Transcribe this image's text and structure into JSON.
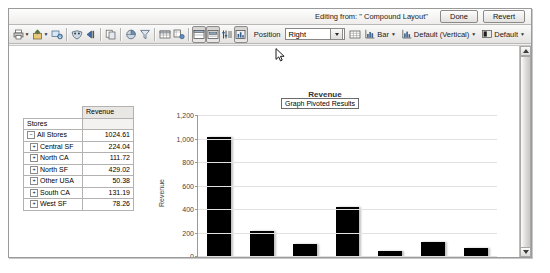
{
  "header": {
    "editing_from": "Editing from: \" Compound Layout\"",
    "done_label": "Done",
    "revert_label": "Revert"
  },
  "toolbar": {
    "icons": [
      {
        "name": "print-icon",
        "caret": true
      },
      {
        "name": "export-icon",
        "caret": true
      },
      {
        "name": "download-icon",
        "caret": false
      },
      {
        "name": "mask-icon",
        "caret": false
      },
      {
        "name": "move-left-icon",
        "caret": false
      },
      {
        "name": "duplicate-icon",
        "caret": false
      },
      {
        "name": "pie-icon",
        "caret": false
      },
      {
        "name": "funnel-icon",
        "caret": false
      },
      {
        "name": "table-icon",
        "caret": false
      },
      {
        "name": "copy-table-icon",
        "caret": false
      },
      {
        "name": "layout-icon",
        "caret": false
      },
      {
        "name": "section-icon",
        "caret": false
      },
      {
        "name": "sort-icon",
        "caret": false
      },
      {
        "name": "graph-pivoted-results-icon",
        "caret": false
      }
    ],
    "position_label": "Position",
    "position_value": "Right",
    "grid_icon": "grid-icon",
    "chart_type_label": "Bar",
    "chart_style_label": "Default (Vertical)",
    "chart_theme_label": "Default"
  },
  "tooltip": {
    "text": "Graph Pivoted Results"
  },
  "pivot": {
    "corner": "",
    "measure_header": "Revenue",
    "row_header": "Stores",
    "rows": [
      {
        "label": "All Stores",
        "value": "1024.61",
        "level": 0
      },
      {
        "label": "Central SF",
        "value": "224.04",
        "level": 1
      },
      {
        "label": "North CA",
        "value": "111.72",
        "level": 1
      },
      {
        "label": "North SF",
        "value": "429.02",
        "level": 1
      },
      {
        "label": "Other USA",
        "value": "50.38",
        "level": 1
      },
      {
        "label": "South CA",
        "value": "131.19",
        "level": 1
      },
      {
        "label": "West SF",
        "value": "78.26",
        "level": 1
      }
    ]
  },
  "chart_data": {
    "type": "bar",
    "title": "Revenue",
    "xlabel": "Stores",
    "ylabel": "Revenue",
    "categories": [
      "All Stores",
      "Central SF",
      "North CA",
      "North SF",
      "Other USA",
      "South CA",
      "West SF"
    ],
    "values": [
      1024.61,
      224.04,
      111.72,
      429.02,
      50.38,
      131.19,
      78.26
    ],
    "yticks": [
      "0",
      "200",
      "400",
      "600",
      "800",
      "1,000",
      "1,200"
    ],
    "ytick_values": [
      0,
      200,
      400,
      600,
      800,
      1000,
      1200
    ],
    "ylim": [
      0,
      1200
    ],
    "grid": true,
    "legend": false,
    "series_color": "#000000"
  },
  "scrollbar": {
    "up_arrow": "scroll-up-icon",
    "down_arrow": "scroll-down-icon"
  }
}
